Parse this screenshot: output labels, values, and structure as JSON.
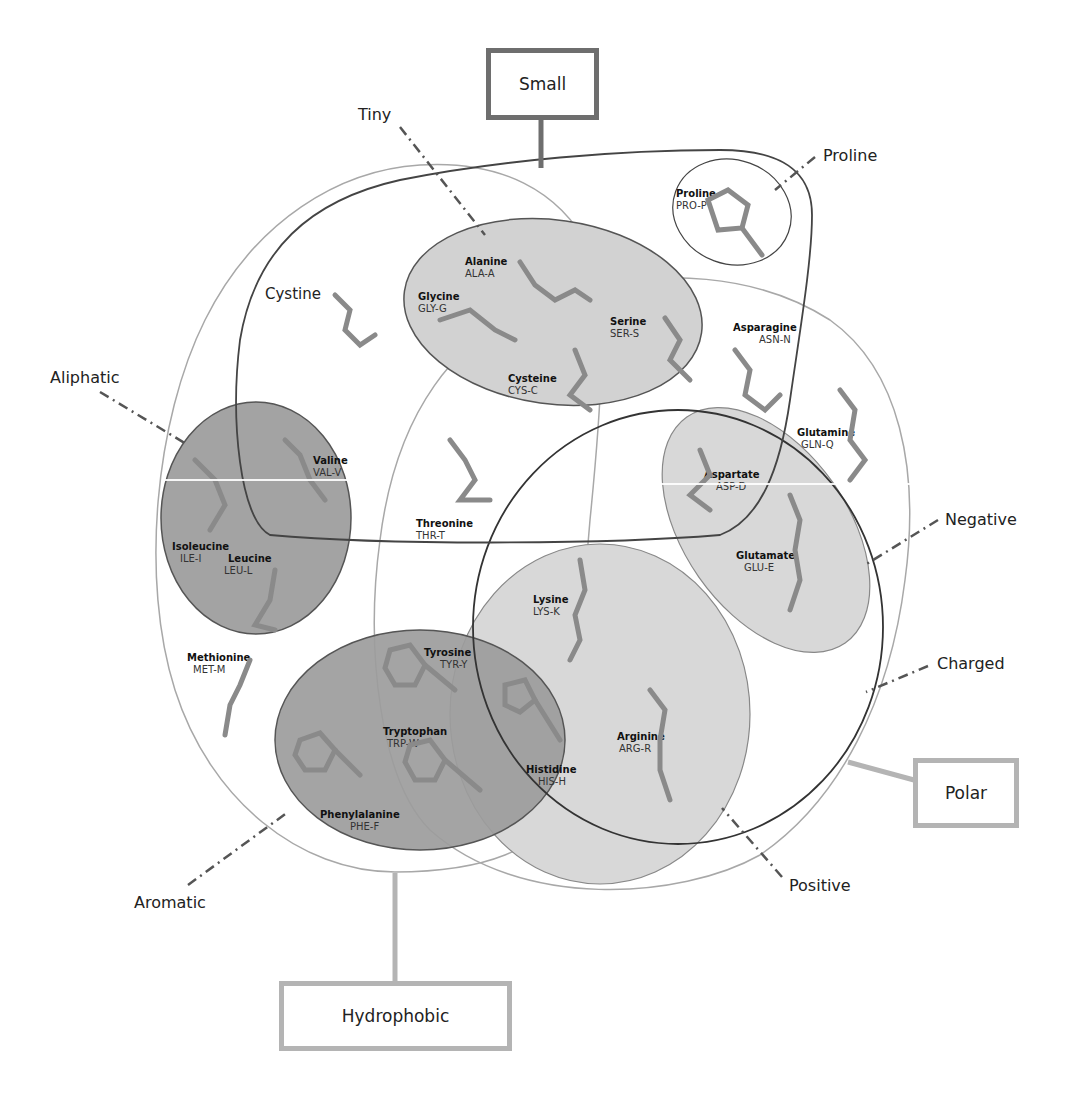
{
  "diagram": {
    "category_boxes": [
      {
        "id": "small",
        "label": "Small"
      },
      {
        "id": "polar",
        "label": "Polar"
      },
      {
        "id": "hydrophobic",
        "label": "Hydrophobic"
      }
    ],
    "subset_labels": [
      {
        "id": "tiny",
        "label": "Tiny"
      },
      {
        "id": "proline",
        "label": "Proline"
      },
      {
        "id": "aliphatic",
        "label": "Aliphatic"
      },
      {
        "id": "negative",
        "label": "Negative"
      },
      {
        "id": "charged",
        "label": "Charged"
      },
      {
        "id": "positive",
        "label": "Positive"
      },
      {
        "id": "aromatic",
        "label": "Aromatic"
      }
    ],
    "inner_labels": [
      {
        "id": "cystine",
        "label": "Cystine"
      }
    ],
    "amino_acids": [
      {
        "name": "Proline",
        "code": "PRO-P"
      },
      {
        "name": "Alanine",
        "code": "ALA-A"
      },
      {
        "name": "Glycine",
        "code": "GLY-G"
      },
      {
        "name": "Serine",
        "code": "SER-S"
      },
      {
        "name": "Cysteine",
        "code": "CYS-C"
      },
      {
        "name": "Asparagine",
        "code": "ASN-N"
      },
      {
        "name": "Glutamine",
        "code": "GLN-Q"
      },
      {
        "name": "Valine",
        "code": "VAL-V"
      },
      {
        "name": "Isoleucine",
        "code": "ILE-I"
      },
      {
        "name": "Leucine",
        "code": "LEU-L"
      },
      {
        "name": "Threonine",
        "code": "THR-T"
      },
      {
        "name": "Aspartate",
        "code": "ASP-D"
      },
      {
        "name": "Glutamate",
        "code": "GLU-E"
      },
      {
        "name": "Lysine",
        "code": "LYS-K"
      },
      {
        "name": "Methionine",
        "code": "MET-M"
      },
      {
        "name": "Tyrosine",
        "code": "TYR-Y"
      },
      {
        "name": "Tryptophan",
        "code": "TRP-W"
      },
      {
        "name": "Histidine",
        "code": "HIS-H"
      },
      {
        "name": "Arginine",
        "code": "ARG-R"
      },
      {
        "name": "Phenylalanine",
        "code": "PHE-F"
      }
    ]
  },
  "colors": {
    "dark_outline": "#4a4a4a",
    "light_outline": "#a8a8a8",
    "box_dark": "#6e6e6e",
    "box_light": "#b4b4b4",
    "fill_light": "#d6d6d6",
    "fill_mid": "#c8c8c8",
    "fill_dark": "#9a9a9a"
  }
}
